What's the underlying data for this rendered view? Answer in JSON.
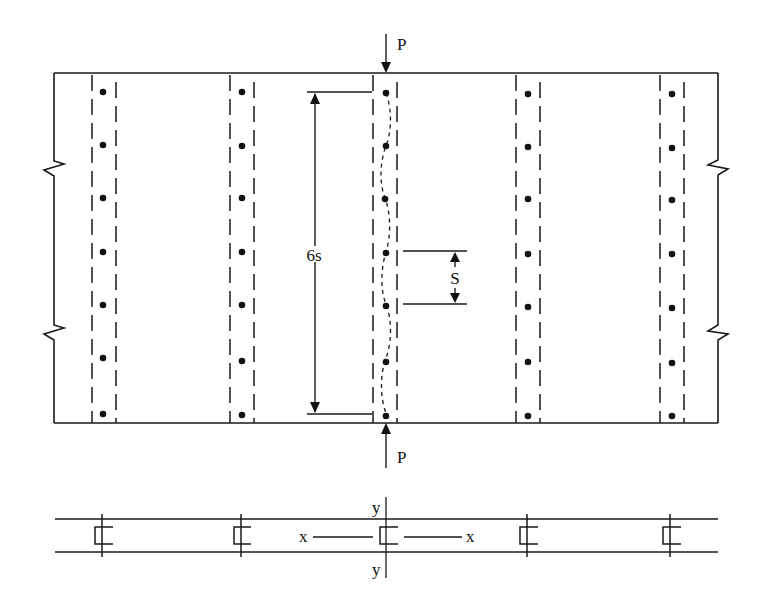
{
  "figure": {
    "type": "engineering-diagram"
  },
  "colors": {
    "line": "#1a1a1a",
    "background": "#ffffff"
  },
  "plan_view": {
    "load_top_label": "P",
    "load_bottom_label": "P",
    "dimension_6s_label": "6s",
    "dimension_s_label": "S",
    "stiffener_count": 5,
    "fasteners_per_line": 7,
    "buckled_line_index": 2,
    "break_marks": [
      "left",
      "right"
    ]
  },
  "section_view": {
    "x_axis_left_label": "x",
    "x_axis_right_label": "x",
    "y_axis_top_label": "y",
    "y_axis_bottom_label": "y",
    "stiffener_count": 5
  }
}
